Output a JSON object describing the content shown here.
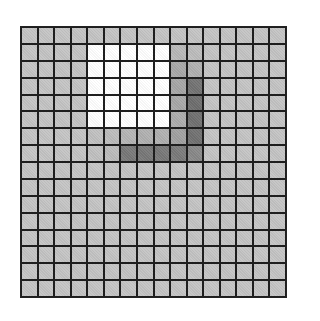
{
  "grid": {
    "rows": 16,
    "cols": 16,
    "default_color": "#c4c4c4",
    "line_color": "#1e1e1e",
    "cells": [
      [
        "#c4c4c4",
        "#c4c4c4",
        "#c4c4c4",
        "#c4c4c4",
        "#c4c4c4",
        "#c4c4c4",
        "#c4c4c4",
        "#c4c4c4",
        "#c4c4c4",
        "#c4c4c4",
        "#c4c4c4",
        "#c4c4c4",
        "#c4c4c4",
        "#c4c4c4",
        "#c4c4c4",
        "#c4c4c4"
      ],
      [
        "#c4c4c4",
        "#c4c4c4",
        "#c4c4c4",
        "#c4c4c4",
        "#ffffff",
        "#ffffff",
        "#ffffff",
        "#ffffff",
        "#ffffff",
        "#b8b8b8",
        "#bcbcbc",
        "#c4c4c4",
        "#c4c4c4",
        "#c4c4c4",
        "#c4c4c4",
        "#c4c4c4"
      ],
      [
        "#c4c4c4",
        "#c4c4c4",
        "#c4c4c4",
        "#c4c4c4",
        "#ffffff",
        "#ffffff",
        "#ffffff",
        "#ffffff",
        "#ffffff",
        "#a8a8a8",
        "#b0b0b0",
        "#c4c4c4",
        "#c4c4c4",
        "#c4c4c4",
        "#c4c4c4",
        "#c4c4c4"
      ],
      [
        "#c4c4c4",
        "#c4c4c4",
        "#c4c4c4",
        "#c4c4c4",
        "#ffffff",
        "#ffffff",
        "#ffffff",
        "#ffffff",
        "#ffffff",
        "#a6a6a6",
        "#737373",
        "#c4c4c4",
        "#c4c4c4",
        "#c4c4c4",
        "#c4c4c4",
        "#c4c4c4"
      ],
      [
        "#c4c4c4",
        "#c4c4c4",
        "#c4c4c4",
        "#c4c4c4",
        "#ffffff",
        "#ffffff",
        "#ffffff",
        "#ffffff",
        "#ffffff",
        "#a8a8a8",
        "#6e6e6e",
        "#c4c4c4",
        "#c4c4c4",
        "#c4c4c4",
        "#c4c4c4",
        "#c4c4c4"
      ],
      [
        "#c4c4c4",
        "#c4c4c4",
        "#c4c4c4",
        "#c4c4c4",
        "#ffffff",
        "#ffffff",
        "#ffffff",
        "#ffffff",
        "#ffffff",
        "#acacac",
        "#707070",
        "#c4c4c4",
        "#c4c4c4",
        "#c4c4c4",
        "#c4c4c4",
        "#c4c4c4"
      ],
      [
        "#c4c4c4",
        "#c4c4c4",
        "#c4c4c4",
        "#c4c4c4",
        "#c0c0c0",
        "#bbbbbb",
        "#b4b4b4",
        "#b0b0b0",
        "#b0b0b0",
        "#a0a0a0",
        "#717171",
        "#c4c4c4",
        "#c4c4c4",
        "#c4c4c4",
        "#c4c4c4",
        "#c4c4c4"
      ],
      [
        "#c4c4c4",
        "#c4c4c4",
        "#c4c4c4",
        "#c4c4c4",
        "#c0c0c0",
        "#bbbbbb",
        "#787878",
        "#787878",
        "#787878",
        "#7a7a7a",
        "#888888",
        "#c4c4c4",
        "#c4c4c4",
        "#c4c4c4",
        "#c4c4c4",
        "#c4c4c4"
      ],
      [
        "#c4c4c4",
        "#c4c4c4",
        "#c4c4c4",
        "#c4c4c4",
        "#c4c4c4",
        "#c4c4c4",
        "#c4c4c4",
        "#c4c4c4",
        "#c4c4c4",
        "#c4c4c4",
        "#c4c4c4",
        "#c4c4c4",
        "#c4c4c4",
        "#c4c4c4",
        "#c4c4c4",
        "#c4c4c4"
      ],
      [
        "#c4c4c4",
        "#c4c4c4",
        "#c4c4c4",
        "#c4c4c4",
        "#c4c4c4",
        "#c4c4c4",
        "#c4c4c4",
        "#c4c4c4",
        "#c4c4c4",
        "#c4c4c4",
        "#c4c4c4",
        "#c4c4c4",
        "#c4c4c4",
        "#c4c4c4",
        "#c4c4c4",
        "#c4c4c4"
      ],
      [
        "#c4c4c4",
        "#c4c4c4",
        "#c4c4c4",
        "#c4c4c4",
        "#c4c4c4",
        "#c4c4c4",
        "#c4c4c4",
        "#c4c4c4",
        "#c4c4c4",
        "#c4c4c4",
        "#c4c4c4",
        "#c4c4c4",
        "#c4c4c4",
        "#c4c4c4",
        "#c4c4c4",
        "#c4c4c4"
      ],
      [
        "#c4c4c4",
        "#c4c4c4",
        "#c4c4c4",
        "#c4c4c4",
        "#c4c4c4",
        "#c4c4c4",
        "#c4c4c4",
        "#c4c4c4",
        "#c4c4c4",
        "#c4c4c4",
        "#c4c4c4",
        "#c4c4c4",
        "#c4c4c4",
        "#c4c4c4",
        "#c4c4c4",
        "#c4c4c4"
      ],
      [
        "#c4c4c4",
        "#c4c4c4",
        "#c4c4c4",
        "#c4c4c4",
        "#c4c4c4",
        "#c4c4c4",
        "#c4c4c4",
        "#c4c4c4",
        "#c4c4c4",
        "#c4c4c4",
        "#c4c4c4",
        "#c4c4c4",
        "#c4c4c4",
        "#c4c4c4",
        "#c4c4c4",
        "#c4c4c4"
      ],
      [
        "#c4c4c4",
        "#c4c4c4",
        "#c4c4c4",
        "#c4c4c4",
        "#c4c4c4",
        "#c4c4c4",
        "#c4c4c4",
        "#c4c4c4",
        "#c4c4c4",
        "#c4c4c4",
        "#c4c4c4",
        "#c4c4c4",
        "#c4c4c4",
        "#c4c4c4",
        "#c4c4c4",
        "#c4c4c4"
      ],
      [
        "#c4c4c4",
        "#c4c4c4",
        "#c4c4c4",
        "#c4c4c4",
        "#c4c4c4",
        "#c4c4c4",
        "#c4c4c4",
        "#c4c4c4",
        "#c4c4c4",
        "#c4c4c4",
        "#c4c4c4",
        "#c4c4c4",
        "#c4c4c4",
        "#c4c4c4",
        "#c4c4c4",
        "#c4c4c4"
      ],
      [
        "#c4c4c4",
        "#c4c4c4",
        "#c4c4c4",
        "#c4c4c4",
        "#c4c4c4",
        "#c4c4c4",
        "#c4c4c4",
        "#c4c4c4",
        "#c4c4c4",
        "#c4c4c4",
        "#c4c4c4",
        "#c4c4c4",
        "#c4c4c4",
        "#c4c4c4",
        "#c4c4c4",
        "#c4c4c4"
      ]
    ]
  }
}
